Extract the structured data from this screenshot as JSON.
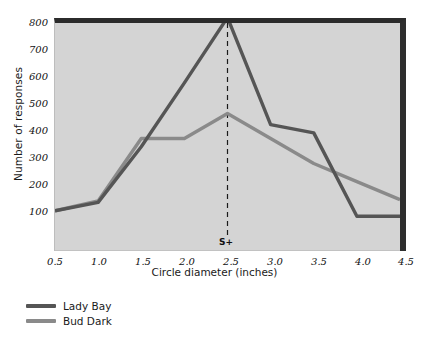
{
  "chart_data": {
    "type": "line",
    "title": "",
    "xlabel": "Circle diameter (inches)",
    "ylabel": "Number of responses",
    "x": [
      0.5,
      1.0,
      1.5,
      2.0,
      2.5,
      3.0,
      3.5,
      4.0,
      4.5
    ],
    "xtick_labels": [
      "0.5",
      "1.0",
      "1.5",
      "2.0",
      "2.5",
      "3.0",
      "3.5",
      "4.0",
      "4.5"
    ],
    "ytick_labels": [
      "100",
      "200",
      "300",
      "400",
      "500",
      "600",
      "700",
      "800"
    ],
    "ytick_values": [
      100,
      200,
      300,
      400,
      500,
      600,
      700,
      800
    ],
    "xlim": [
      0.5,
      4.5
    ],
    "ylim": [
      0,
      820
    ],
    "grid": false,
    "legend_position": "below-left",
    "series": [
      {
        "name": "Lady Bay",
        "color": "#555555",
        "values": [
          80,
          110,
          310,
          540,
          775,
          390,
          360,
          60,
          60
        ]
      },
      {
        "name": "Bud Dark",
        "color": "#8a8a8a",
        "values": [
          80,
          115,
          340,
          340,
          430,
          340,
          250,
          185,
          120
        ]
      }
    ],
    "annotations": [
      {
        "label": "S+",
        "x": 2.5,
        "style": "dashed-vertical-line",
        "color": "#1a1a1a"
      }
    ],
    "plot_background": "#d4d4d4"
  }
}
